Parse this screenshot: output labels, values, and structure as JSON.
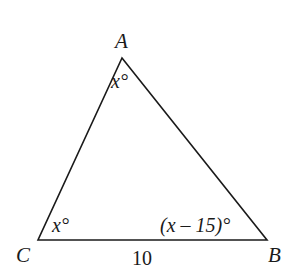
{
  "diagram": {
    "type": "triangle",
    "vertices": {
      "A": {
        "label": "A",
        "x": 122,
        "y": 58
      },
      "B": {
        "label": "B",
        "x": 267,
        "y": 240
      },
      "C": {
        "label": "C",
        "x": 38,
        "y": 240
      }
    },
    "angles": {
      "A": "x°",
      "C": "x°",
      "B": "(x – 15)°"
    },
    "sides": {
      "CB": "10"
    },
    "stroke_color": "#1a1a1a",
    "background": "#ffffff"
  }
}
